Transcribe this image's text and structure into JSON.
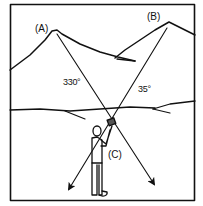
{
  "diagram": {
    "type": "compass resection illustration",
    "colors": {
      "ink": "#111111",
      "paper": "#ffffff"
    },
    "landmarks": [
      {
        "id": "A",
        "label": "(A)",
        "bearing_label": "330°"
      },
      {
        "id": "B",
        "label": "(B)",
        "bearing_label": "35°"
      }
    ],
    "observer": {
      "label": "(C)"
    }
  }
}
